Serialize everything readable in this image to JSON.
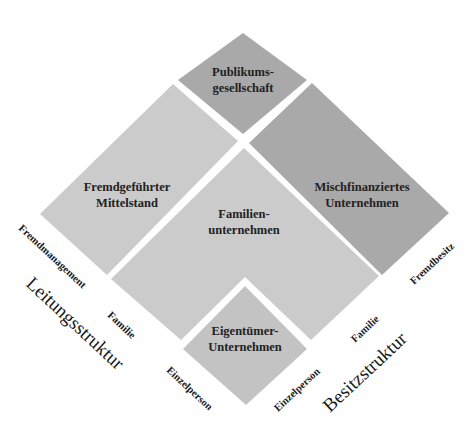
{
  "colors": {
    "background": "#ffffff",
    "light_gray": "#cbcbcb",
    "medium_gray": "#c3c3c3",
    "dark_gray": "#a9a9a9",
    "text": "#222222"
  },
  "cells": {
    "publikum": {
      "line1": "Publikums-",
      "line2": "gesellschaft",
      "fill": "#a9a9a9"
    },
    "mischfinanziert": {
      "line1": "Mischfinanziertes",
      "line2": "Unternehmen",
      "fill": "#a9a9a9"
    },
    "fremdgefuehrt": {
      "line1": "Fremdgeführter",
      "line2": "Mittelstand",
      "fill": "#cbcbcb"
    },
    "familien": {
      "line1": "Familien-",
      "line2": "unternehmen",
      "fill": "#cbcbcb"
    },
    "eigentuemer": {
      "line1": "Eigentümer-",
      "line2": "Unternehmen",
      "fill": "#c3c3c3"
    }
  },
  "axes": {
    "leitung": {
      "title": "Leitungsstruktur",
      "ticks": [
        "Fremdmanagement",
        "Familie",
        "Einzelperson"
      ]
    },
    "besitz": {
      "title": "Besitzstruktur",
      "ticks": [
        "Einzelperson",
        "Familie",
        "Fremdbesitz"
      ]
    }
  }
}
